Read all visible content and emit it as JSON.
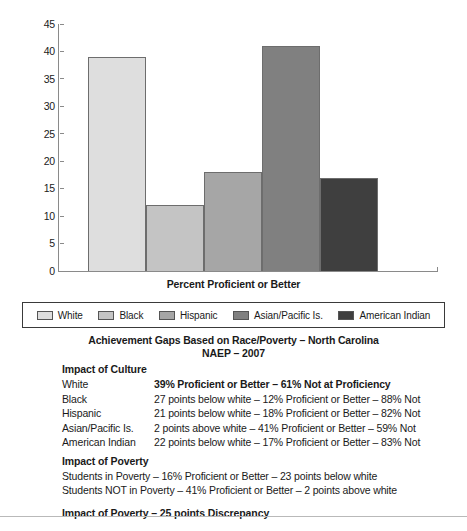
{
  "chart_data": {
    "type": "bar",
    "title": "Achievement Gaps Based on Race/Poverty – North Carolina",
    "subtitle": "NAEP – 2007",
    "xlabel": "Percent Proficient or Better",
    "ylabel": "",
    "ylim": [
      0,
      45
    ],
    "yticks": [
      45,
      40,
      35,
      30,
      25,
      20,
      15,
      10,
      5,
      0
    ],
    "grid": false,
    "legend_position": "below-plot",
    "categories": [
      "White",
      "Black",
      "Hispanic",
      "Asian/Pacific Is.",
      "American Indian"
    ],
    "values": [
      39,
      12,
      18,
      41,
      17
    ],
    "colors": [
      "#DEDEDE",
      "#C4C4C4",
      "#A6A6A6",
      "#808080",
      "#3F3F3F"
    ],
    "series": [
      {
        "name": "Percent Proficient or Better",
        "values": [
          39,
          12,
          18,
          41,
          17
        ]
      }
    ]
  },
  "chart": {
    "x_axis_title": "Percent Proficient or Better",
    "y_ticks": [
      "45",
      "40",
      "35",
      "30",
      "25",
      "20",
      "15",
      "10",
      "5",
      "0"
    ],
    "bars": [
      {
        "label": "White",
        "value": 39,
        "color": "#DEDEDE"
      },
      {
        "label": "Black",
        "value": 12,
        "color": "#C4C4C4"
      },
      {
        "label": "Hispanic",
        "value": 18,
        "color": "#A6A6A6"
      },
      {
        "label": "Asian/Pacific Is.",
        "value": 41,
        "color": "#808080"
      },
      {
        "label": "American Indian",
        "value": 17,
        "color": "#3F3F3F"
      }
    ]
  },
  "legend": {
    "items": [
      {
        "label": "White",
        "color": "#DEDEDE"
      },
      {
        "label": "Black",
        "color": "#C4C4C4"
      },
      {
        "label": "Hispanic",
        "color": "#A6A6A6"
      },
      {
        "label": "Asian/Pacific Is.",
        "color": "#808080"
      },
      {
        "label": "American Indian",
        "color": "#3F3F3F"
      }
    ]
  },
  "titles": {
    "main": "Achievement Gaps Based on Race/Poverty – North Carolina",
    "sub": "NAEP – 2007"
  },
  "details": {
    "culture_heading": "Impact of Culture",
    "culture_rows": [
      {
        "key": "White",
        "value": "39% Proficient or Better – 61% Not at Proficiency",
        "bold": true
      },
      {
        "key": "Black",
        "value": "27 points below white – 12% Proficient or Better – 88% Not",
        "bold": false
      },
      {
        "key": "Hispanic",
        "value": "21 points below white – 18% Proficient or Better – 82% Not",
        "bold": false
      },
      {
        "key": "Asian/Pacific Is.",
        "value": "2 points above white – 41% Proficient or Better – 59% Not",
        "bold": false
      },
      {
        "key": "American Indian",
        "value": "22 points below white – 17% Proficient or Better – 83% Not",
        "bold": false
      }
    ],
    "poverty_heading": "Impact of Poverty",
    "poverty_lines": [
      "Students in Poverty – 16% Proficient or Better – 23 points below white",
      "Students NOT in Poverty – 41% Proficient or Better – 2 points above white"
    ],
    "summary": "Impact of Poverty – 25 points Discrepancy"
  }
}
